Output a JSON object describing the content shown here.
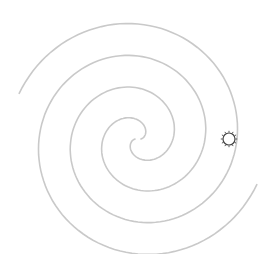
{
  "diagram": {
    "title": "Spiral diagram with sun marker",
    "background": "#ffffff",
    "spiral": {
      "center": [
        138,
        139
      ],
      "stroke_color": "#c9c9c9",
      "stroke_width": 1.6,
      "pitch_per_turn": 64,
      "arms": [
        {
          "name": "arm-a",
          "start_angle_deg": 0,
          "end_angle_deg": 700,
          "rotation_deg": 180
        },
        {
          "name": "arm-b",
          "start_angle_deg": 0,
          "end_angle_deg": 700,
          "rotation_deg": 0
        }
      ]
    },
    "marker": {
      "type": "sun-icon",
      "position": [
        229,
        139
      ],
      "radius": 6,
      "ray_count": 12,
      "color": "#444444"
    }
  }
}
